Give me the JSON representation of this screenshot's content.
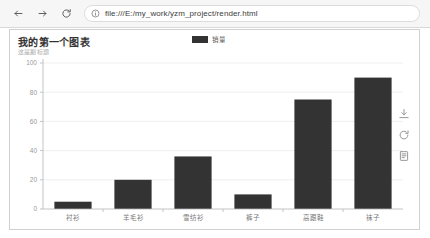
{
  "browser": {
    "back_icon": "arrow-left-icon",
    "forward_icon": "arrow-right-icon",
    "reload_icon": "reload-icon",
    "site_info_icon": "info-circle-icon",
    "url": "file:///E:/my_work/yzm_project/render.html"
  },
  "chart_card": {
    "toolbox": [
      {
        "name": "save-as-image-icon",
        "title": "保存为图片"
      },
      {
        "name": "restore-icon",
        "title": "还原"
      },
      {
        "name": "data-view-icon",
        "title": "数据视图"
      }
    ]
  },
  "chart_data": {
    "type": "bar",
    "title": "我的第一个图表",
    "subtitle": "这是副标题",
    "categories": [
      "衬衫",
      "羊毛衫",
      "雪纺衫",
      "裤子",
      "高跟鞋",
      "袜子"
    ],
    "series": [
      {
        "name": "销量",
        "values": [
          5,
          20,
          36,
          10,
          75,
          90
        ],
        "color": "#333333"
      }
    ],
    "legend": [
      "销量"
    ],
    "legend_position": "top-center",
    "xlabel": "",
    "ylabel": "",
    "ylim": [
      0,
      100
    ],
    "yticks": [
      0,
      20,
      40,
      60,
      80,
      100
    ],
    "grid": true
  }
}
